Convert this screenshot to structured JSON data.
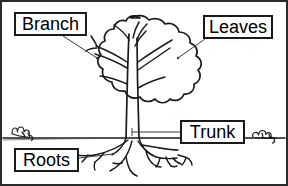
{
  "diagram": {
    "style": "black-and-white line drawing",
    "canvas": {
      "width": 288,
      "height": 186
    },
    "colors": {
      "background": "#ffffff",
      "ink": "#1a1a1a",
      "frame": "#2b2b2b",
      "leader_line": "#3a3a3a"
    }
  },
  "labels": [
    {
      "id": "branch",
      "text": "Branch",
      "points_to": "upper-left branch fork"
    },
    {
      "id": "leaves",
      "text": "Leaves",
      "points_to": "right canopy foliage"
    },
    {
      "id": "trunk",
      "text": "Trunk",
      "points_to": "main trunk above ground"
    },
    {
      "id": "roots",
      "text": "Roots",
      "points_to": "root system below ground"
    }
  ],
  "parts": {
    "canopy": "scalloped cloud-shaped foliage crown",
    "trunk": "vertical central stem",
    "branches": "forked limbs inside canopy",
    "ground_line": "horizontal horizon line",
    "roots": "branching roots spreading below ground",
    "shrubs": "small bushes on left and right horizon"
  }
}
